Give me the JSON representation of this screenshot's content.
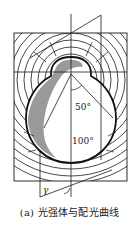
{
  "figure": {
    "caption": "(a) 光强体与配光曲线",
    "labels": {
      "angle_50": "50°",
      "angle_100": "100°",
      "gamma": "γ"
    },
    "colors": {
      "line": "#1a1a1a",
      "shade": "#9a9a9a",
      "background": "#ffffff"
    }
  }
}
